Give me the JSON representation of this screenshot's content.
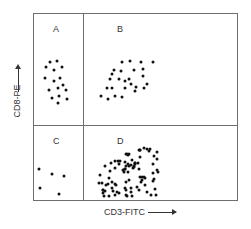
{
  "chart_data": {
    "type": "scatter",
    "title": "",
    "xlabel": "CD3-FITC",
    "ylabel": "CD8-PE",
    "grid": false,
    "quadrants": [
      {
        "label": "A",
        "position": "upper-left",
        "description": "CD3- CD8+",
        "count": 16
      },
      {
        "label": "B",
        "position": "upper-right",
        "description": "CD3+ CD8+",
        "count": 26
      },
      {
        "label": "C",
        "position": "lower-left",
        "description": "CD3- CD8-",
        "count": 5
      },
      {
        "label": "D",
        "position": "lower-right",
        "description": "CD3+ CD8-",
        "count": 90
      }
    ],
    "series": [
      {
        "name": "A",
        "points": [
          [
            50,
            62
          ],
          [
            57,
            61
          ],
          [
            46,
            67
          ],
          [
            54,
            70
          ],
          [
            62,
            67
          ],
          [
            45,
            78
          ],
          [
            54,
            81
          ],
          [
            60,
            78
          ],
          [
            49,
            90
          ],
          [
            58,
            88
          ],
          [
            66,
            90
          ],
          [
            63,
            85
          ],
          [
            52,
            98
          ],
          [
            59,
            96
          ],
          [
            67,
            99
          ],
          [
            58,
            103
          ]
        ]
      },
      {
        "name": "B",
        "points": [
          [
            122,
            62
          ],
          [
            130,
            61
          ],
          [
            141,
            62
          ],
          [
            153,
            62
          ],
          [
            114,
            70
          ],
          [
            121,
            71
          ],
          [
            134,
            70
          ],
          [
            143,
            69
          ],
          [
            110,
            79
          ],
          [
            112,
            74
          ],
          [
            119,
            79
          ],
          [
            129,
            79
          ],
          [
            143,
            76
          ],
          [
            107,
            88
          ],
          [
            112,
            88
          ],
          [
            125,
            81
          ],
          [
            125,
            88
          ],
          [
            136,
            87
          ],
          [
            147,
            84
          ],
          [
            101,
            96
          ],
          [
            108,
            99
          ],
          [
            115,
            96
          ],
          [
            122,
            97
          ],
          [
            135,
            91
          ],
          [
            144,
            88
          ],
          [
            131,
            84
          ]
        ]
      },
      {
        "name": "C",
        "points": [
          [
            39,
            169
          ],
          [
            52,
            174
          ],
          [
            64,
            176
          ],
          [
            40,
            188
          ],
          [
            59,
            194
          ]
        ]
      },
      {
        "name": "D",
        "points": []
      }
    ],
    "point_units": "pixel coordinates in 251x229 image"
  },
  "labels": {
    "quadrant_a": "A",
    "quadrant_b": "B",
    "quadrant_c": "C",
    "quadrant_d": "D",
    "x_axis": "CD3-FITC",
    "y_axis": "CD8-PE"
  },
  "colors": {
    "dot": "#111111",
    "frame": "#6e6e6e"
  }
}
